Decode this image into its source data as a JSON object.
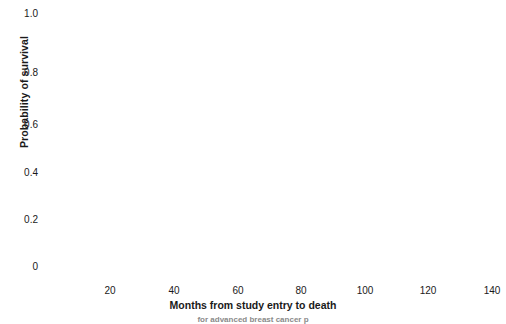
{
  "chart_data": {
    "type": "line",
    "title": "",
    "xlabel": "Months from study entry to death",
    "ylabel": "Probability of survival",
    "xlim": [
      0,
      140
    ],
    "ylim": [
      0,
      1.0
    ],
    "grid": true,
    "legend_position": "none",
    "xticks": [
      "20",
      "40",
      "60",
      "80",
      "100",
      "120",
      "140"
    ],
    "xtick_values": [
      20,
      40,
      60,
      80,
      100,
      120,
      140
    ],
    "yticks": [
      "0",
      "0.2",
      "0.4",
      "0.6",
      "0.8",
      "1.0"
    ],
    "ytick_values": [
      0,
      0.2,
      0.4,
      0.6,
      0.8,
      1.0
    ],
    "series": [
      {
        "name": "A",
        "marker": "A",
        "points": [
          {
            "x": 2,
            "y": 0.985
          },
          {
            "x": 4,
            "y": 0.985
          },
          {
            "x": 4,
            "y": 0.955
          },
          {
            "x": 6,
            "y": 0.955
          },
          {
            "x": 7,
            "y": 0.925
          },
          {
            "x": 9,
            "y": 0.925
          },
          {
            "x": 8,
            "y": 0.895
          },
          {
            "x": 10,
            "y": 0.895
          },
          {
            "x": 10,
            "y": 0.8
          },
          {
            "x": 11,
            "y": 0.77
          },
          {
            "x": 13,
            "y": 0.77
          },
          {
            "x": 12,
            "y": 0.665
          },
          {
            "x": 15,
            "y": 0.545
          },
          {
            "x": 15,
            "y": 0.4
          },
          {
            "x": 15,
            "y": 0.365
          },
          {
            "x": 17,
            "y": 0.365
          },
          {
            "x": 17,
            "y": 0.335
          },
          {
            "x": 19,
            "y": 0.335
          },
          {
            "x": 20,
            "y": 0.265
          },
          {
            "x": 22,
            "y": 0.265
          },
          {
            "x": 24,
            "y": 0.265
          },
          {
            "x": 25,
            "y": 0.215
          },
          {
            "x": 27,
            "y": 0.215
          },
          {
            "x": 28,
            "y": 0.185
          },
          {
            "x": 34,
            "y": 0.185
          },
          {
            "x": 35,
            "y": 0.155
          },
          {
            "x": 38,
            "y": 0.155
          },
          {
            "x": 39,
            "y": 0.125
          },
          {
            "x": 41,
            "y": 0.125
          },
          {
            "x": 42,
            "y": 0.095
          },
          {
            "x": 52,
            "y": 0.095
          },
          {
            "x": 52,
            "y": 0.04
          }
        ]
      },
      {
        "name": "B",
        "marker": "B",
        "points": [
          {
            "x": 3,
            "y": 0.955
          },
          {
            "x": 5,
            "y": 0.955
          },
          {
            "x": 4,
            "y": 0.925
          },
          {
            "x": 5,
            "y": 0.895
          },
          {
            "x": 7,
            "y": 0.895
          },
          {
            "x": 6,
            "y": 0.8
          },
          {
            "x": 8,
            "y": 0.8
          },
          {
            "x": 10,
            "y": 0.77
          },
          {
            "x": 12,
            "y": 0.77
          },
          {
            "x": 11,
            "y": 0.735
          },
          {
            "x": 13,
            "y": 0.735
          },
          {
            "x": 17,
            "y": 0.575
          },
          {
            "x": 18,
            "y": 0.545
          },
          {
            "x": 20,
            "y": 0.5
          },
          {
            "x": 22,
            "y": 0.5
          },
          {
            "x": 22,
            "y": 0.455
          },
          {
            "x": 33,
            "y": 0.455
          },
          {
            "x": 48,
            "y": 0.4
          },
          {
            "x": 52,
            "y": 0.4
          },
          {
            "x": 50,
            "y": 0.365
          },
          {
            "x": 64,
            "y": 0.365
          },
          {
            "x": 64,
            "y": 0.305
          },
          {
            "x": 67,
            "y": 0.305
          },
          {
            "x": 68,
            "y": 0.275
          },
          {
            "x": 76,
            "y": 0.275
          },
          {
            "x": 73,
            "y": 0.245
          },
          {
            "x": 77,
            "y": 0.245
          },
          {
            "x": 81,
            "y": 0.245
          },
          {
            "x": 80,
            "y": 0.215
          },
          {
            "x": 86,
            "y": 0.215
          },
          {
            "x": 90,
            "y": 0.215
          },
          {
            "x": 90,
            "y": 0.185
          },
          {
            "x": 101,
            "y": 0.185
          },
          {
            "x": 104,
            "y": 0.185
          },
          {
            "x": 104,
            "y": 0.155
          },
          {
            "x": 120,
            "y": 0.155
          },
          {
            "x": 120,
            "y": 0.125
          }
        ]
      }
    ],
    "markers": [
      {
        "t": "·",
        "x": 4,
        "y": 0.985
      },
      {
        "t": "A",
        "x": 7,
        "y": 0.985
      },
      {
        "t": "A",
        "x": 11,
        "y": 0.985
      },
      {
        "t": "B",
        "x": 3,
        "y": 0.955
      },
      {
        "t": "B",
        "x": 7,
        "y": 0.955
      },
      {
        "t": "A",
        "x": 11,
        "y": 0.955
      },
      {
        "t": "A",
        "x": 15,
        "y": 0.955
      },
      {
        "t": "B",
        "x": 7,
        "y": 0.925
      },
      {
        "t": "A",
        "x": 15,
        "y": 0.925
      },
      {
        "t": "A",
        "x": 19,
        "y": 0.925
      },
      {
        "t": "B",
        "x": 9,
        "y": 0.893
      },
      {
        "t": "B",
        "x": 13,
        "y": 0.893
      },
      {
        "t": "A",
        "x": 20,
        "y": 0.893
      },
      {
        "t": "A",
        "x": 24,
        "y": 0.893
      },
      {
        "t": "B",
        "x": 9,
        "y": 0.8
      },
      {
        "t": "B",
        "x": 13,
        "y": 0.8
      },
      {
        "t": "A",
        "x": 20,
        "y": 0.8
      },
      {
        "t": "B",
        "x": 13,
        "y": 0.77
      },
      {
        "t": "B",
        "x": 17,
        "y": 0.77
      },
      {
        "t": "A",
        "x": 21,
        "y": 0.77
      },
      {
        "t": "A",
        "x": 25,
        "y": 0.77
      },
      {
        "t": "B",
        "x": 15,
        "y": 0.74
      },
      {
        "t": "B",
        "x": 19,
        "y": 0.74
      },
      {
        "t": "|",
        "x": 23,
        "y": 0.74
      },
      {
        "t": "A",
        "x": 19,
        "y": 0.705
      },
      {
        "t": "·",
        "x": 24,
        "y": 0.705
      },
      {
        "t": "·",
        "x": 22,
        "y": 0.665
      },
      {
        "t": "·",
        "x": 27,
        "y": 0.665
      },
      {
        "t": "·",
        "x": 24,
        "y": 0.615
      },
      {
        "t": "·",
        "x": 24,
        "y": 0.575
      },
      {
        "t": "B",
        "x": 28,
        "y": 0.575
      },
      {
        "t": "A",
        "x": 20,
        "y": 0.545
      },
      {
        "t": "·",
        "x": 25,
        "y": 0.545
      },
      {
        "t": "B",
        "x": 29,
        "y": 0.545
      },
      {
        "t": "|",
        "x": 24,
        "y": 0.508
      },
      {
        "t": "B",
        "x": 28,
        "y": 0.508
      },
      {
        "t": "B",
        "x": 32,
        "y": 0.508
      },
      {
        "t": "|",
        "x": 24,
        "y": 0.472
      },
      {
        "t": "B",
        "x": 31,
        "y": 0.472
      },
      {
        "t": "B",
        "x": 48,
        "y": 0.472
      },
      {
        "t": "A",
        "x": 24,
        "y": 0.435
      },
      {
        "t": "B",
        "x": 48,
        "y": 0.435
      },
      {
        "t": "B",
        "x": 53,
        "y": 0.435
      },
      {
        "t": "A",
        "x": 24,
        "y": 0.4
      },
      {
        "t": "A",
        "x": 28,
        "y": 0.4
      },
      {
        "t": "B",
        "x": 53,
        "y": 0.4
      },
      {
        "t": "B",
        "x": 68,
        "y": 0.4
      },
      {
        "t": "A",
        "x": 28,
        "y": 0.365
      },
      {
        "t": "A",
        "x": 32,
        "y": 0.365
      },
      {
        "t": "|",
        "x": 68,
        "y": 0.365
      },
      {
        "t": "|",
        "x": 30,
        "y": 0.33
      },
      {
        "t": "B",
        "x": 68,
        "y": 0.33
      },
      {
        "t": "B",
        "x": 72,
        "y": 0.33
      },
      {
        "t": "A",
        "x": 31,
        "y": 0.295
      },
      {
        "t": "A",
        "x": 35,
        "y": 0.295
      },
      {
        "t": "A",
        "x": 39,
        "y": 0.295
      },
      {
        "t": "B",
        "x": 73,
        "y": 0.295
      },
      {
        "t": "B",
        "x": 89,
        "y": 0.295
      },
      {
        "t": "A",
        "x": 39,
        "y": 0.262
      },
      {
        "t": "A",
        "x": 43,
        "y": 0.262
      },
      {
        "t": "B",
        "x": 89,
        "y": 0.262
      },
      {
        "t": "B",
        "x": 95,
        "y": 0.262
      },
      {
        "t": "B",
        "x": 101,
        "y": 0.262
      },
      {
        "t": "A",
        "x": 44,
        "y": 0.228
      },
      {
        "t": "A",
        "x": 53,
        "y": 0.228
      },
      {
        "t": "B",
        "x": 101,
        "y": 0.228
      },
      {
        "t": "B",
        "x": 105,
        "y": 0.228
      },
      {
        "t": "·",
        "x": 110,
        "y": 0.228
      },
      {
        "t": "B",
        "x": 115,
        "y": 0.228
      },
      {
        "t": "A",
        "x": 52,
        "y": 0.195
      },
      {
        "t": "A",
        "x": 57,
        "y": 0.195
      },
      {
        "t": "B",
        "x": 115,
        "y": 0.195
      },
      {
        "t": "B",
        "x": 133,
        "y": 0.195
      },
      {
        "t": "B",
        "x": 138,
        "y": 0.195
      },
      {
        "t": "A",
        "x": 56,
        "y": 0.162
      },
      {
        "t": "A",
        "x": 60,
        "y": 0.162
      },
      {
        "t": "B",
        "x": 135,
        "y": 0.162
      },
      {
        "t": "B",
        "x": 157,
        "y": 0.162
      },
      {
        "t": "A",
        "x": 59,
        "y": 0.128
      },
      {
        "t": "B",
        "x": 157,
        "y": 0.128
      },
      {
        "t": "B",
        "x": 172,
        "y": 0.128
      },
      {
        "t": "A",
        "x": 59,
        "y": 0.095
      },
      {
        "t": "A",
        "x": 70,
        "y": 0.095
      },
      {
        "t": "B",
        "x": 172,
        "y": 0.095
      },
      {
        "t": "A",
        "x": 70,
        "y": 0.04
      }
    ],
    "connectors": [
      {
        "x1": 13,
        "y1": 0.45,
        "x2": 33,
        "y2": 0.45,
        "style": "dashed"
      },
      {
        "x1": 36,
        "y1": 0.415,
        "x2": 44,
        "y2": 0.415,
        "style": "dashed"
      },
      {
        "x1": 55,
        "y1": 0.345,
        "x2": 64,
        "y2": 0.345,
        "style": "dashed"
      },
      {
        "x1": 76,
        "y1": 0.275,
        "x2": 84,
        "y2": 0.275,
        "style": "dashed"
      },
      {
        "x1": 93,
        "y1": 0.245,
        "x2": 100,
        "y2": 0.245,
        "style": "dashed"
      },
      {
        "x1": 105,
        "y1": 0.178,
        "x2": 118,
        "y2": 0.178,
        "style": "dashed"
      },
      {
        "x1": 120,
        "y1": 0.145,
        "x2": 130,
        "y2": 0.145,
        "style": "dashed"
      },
      {
        "x1": 41,
        "y1": 0.178,
        "x2": 50,
        "y2": 0.178,
        "style": "dashed"
      },
      {
        "x1": 48,
        "y1": 0.145,
        "x2": 53,
        "y2": 0.145,
        "style": "dashed"
      },
      {
        "x1": 61,
        "y1": 0.11,
        "x2": 68,
        "y2": 0.11,
        "style": "dashed"
      }
    ]
  },
  "axes": {
    "ylabel_text": "Probability of survival",
    "xlabel_text": "Months from study entry to death",
    "ytick_labels": [
      "1.0",
      "0.8",
      "0.6",
      "0.4",
      "0.2",
      "0"
    ],
    "xtick_labels": [
      "20",
      "40",
      "60",
      "80",
      "100",
      "120",
      "140"
    ]
  },
  "caption": {
    "text": "for advanced breast cancer p"
  }
}
